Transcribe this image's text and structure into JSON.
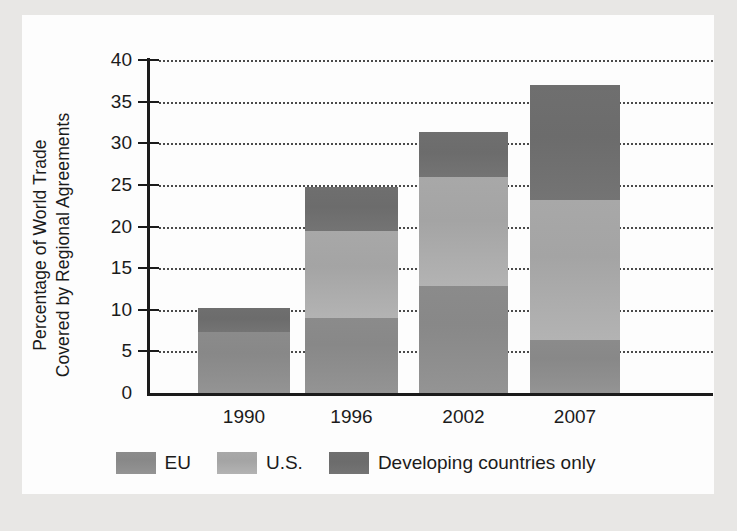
{
  "chart_data": {
    "type": "bar",
    "subtype": "stacked-bar",
    "title": "",
    "xlabel": "",
    "ylabel": "Percentage of World Trade Covered by Regional Agreements",
    "ylabel_lines": [
      "Percentage of World Trade",
      "Covered by Regional Agreements"
    ],
    "categories": [
      "1990",
      "1996",
      "2002",
      "2007"
    ],
    "ylim": [
      0,
      40
    ],
    "yticks": [
      0,
      5,
      10,
      15,
      20,
      25,
      30,
      35,
      40
    ],
    "ytick_labels": [
      "0",
      "5",
      "10",
      "15",
      "20",
      "25",
      "30",
      "35",
      "40"
    ],
    "grid": "horizontal-dotted",
    "legend_position": "bottom",
    "series": [
      {
        "name": "EU",
        "color": "#8b8b8b",
        "values": [
          7.3,
          9.0,
          12.8,
          6.4
        ]
      },
      {
        "name": "U.S.",
        "color": "#a8a8a8",
        "values": [
          0.0,
          10.4,
          13.2,
          16.8
        ]
      },
      {
        "name": "Developing countries only",
        "color": "#6f6f6f",
        "values": [
          2.9,
          5.3,
          5.3,
          13.8
        ]
      }
    ],
    "totals": [
      10.2,
      24.7,
      31.3,
      37.0
    ]
  },
  "legend": {
    "items": [
      {
        "label": "EU",
        "swatch": "legend-swatch-eu"
      },
      {
        "label": "U.S.",
        "swatch": "legend-swatch-us"
      },
      {
        "label": "Developing countries only",
        "swatch": "legend-swatch-dev"
      }
    ]
  },
  "colors": {
    "eu": "#8b8b8b",
    "us": "#a8a8a8",
    "developing": "#6f6f6f",
    "axis": "#1b1b1b",
    "grid": "#4a4a4a",
    "paper": "#fdfdfd",
    "page_background": "#e8e7e5"
  }
}
